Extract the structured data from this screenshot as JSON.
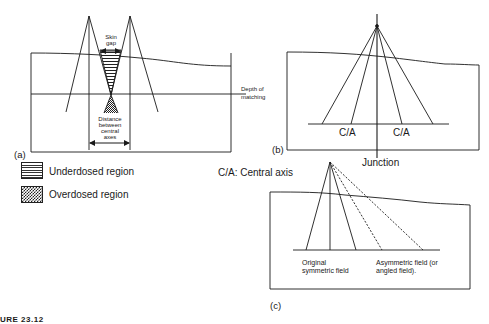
{
  "figure": {
    "caption_fragment": "URE 23.12",
    "panels": {
      "a": {
        "label": "(a)",
        "skin_gap_label": "Skin gap",
        "skin_gap_lines": [
          "Skin",
          "gap"
        ],
        "depth_label_lines": [
          "Depth of",
          "matching"
        ],
        "distance_label_lines": [
          "Distance",
          "between",
          "central",
          "axes"
        ]
      },
      "b": {
        "label": "(b)",
        "central_axis_left": "C/A",
        "central_axis_right": "C/A",
        "junction_label": "Junction"
      },
      "c": {
        "label": "(c)",
        "original_field_lines": [
          "Original",
          "symmetric field"
        ],
        "asymmetric_field_lines": [
          "Asymmetric field (or",
          "angled field)."
        ]
      }
    },
    "legend": {
      "items": [
        {
          "pattern": "horizontal-hatch",
          "label": "Underdosed region"
        },
        {
          "pattern": "checkered",
          "label": "Overdosed region"
        }
      ],
      "abbreviation": "C/A: Central axis"
    },
    "colors": {
      "line": "#1a1a1a",
      "background": "#ffffff"
    }
  }
}
